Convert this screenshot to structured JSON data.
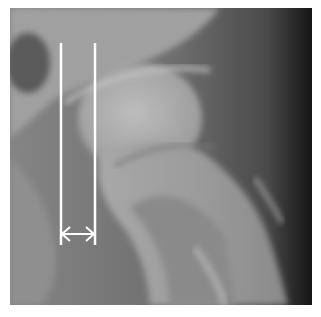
{
  "image": {
    "subject": "Hip joint radiograph (proximal femur and acetabulum)",
    "modality": "X-ray"
  },
  "annotations": {
    "measurement_lines": 2,
    "measurement_arrow": "double-headed horizontal arrow between the two vertical lines",
    "line_color": "#ffffff"
  },
  "colors": {
    "bone_light": "#b4b4b4",
    "soft_tissue": "#7a7a7a",
    "dark_edge": "#1e1e1e",
    "annotation": "#ffffff"
  }
}
